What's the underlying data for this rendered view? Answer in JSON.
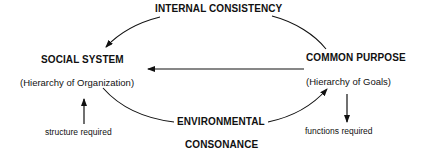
{
  "diagram": {
    "top_label": "INTERNAL CONSISTENCY",
    "left_node": {
      "title": "SOCIAL SYSTEM",
      "subtitle": "(Hierarchy of Organization)",
      "note": "structure required"
    },
    "right_node": {
      "title": "COMMON PURPOSE",
      "subtitle": "(Hierarchy of Goals)",
      "note": "functions required"
    },
    "bottom_label_line1": "ENVIRONMENTAL",
    "bottom_label_line2": "CONSONANCE",
    "edges": [
      {
        "from": "INTERNAL CONSISTENCY",
        "to": "SOCIAL SYSTEM",
        "style": "curved-arrow"
      },
      {
        "from": "INTERNAL CONSISTENCY",
        "to": "COMMON PURPOSE",
        "style": "curved-line"
      },
      {
        "from": "COMMON PURPOSE",
        "to": "SOCIAL SYSTEM",
        "style": "straight-arrow"
      },
      {
        "from": "SOCIAL SYSTEM",
        "to": "ENVIRONMENTAL CONSONANCE",
        "style": "curved-line"
      },
      {
        "from": "ENVIRONMENTAL CONSONANCE",
        "to": "COMMON PURPOSE",
        "style": "curved-arrow"
      },
      {
        "from": "structure required",
        "to": "SOCIAL SYSTEM",
        "style": "vertical-arrow-up"
      },
      {
        "from": "COMMON PURPOSE",
        "to": "functions required",
        "style": "vertical-arrow-down"
      }
    ],
    "line_color": "#111111"
  }
}
